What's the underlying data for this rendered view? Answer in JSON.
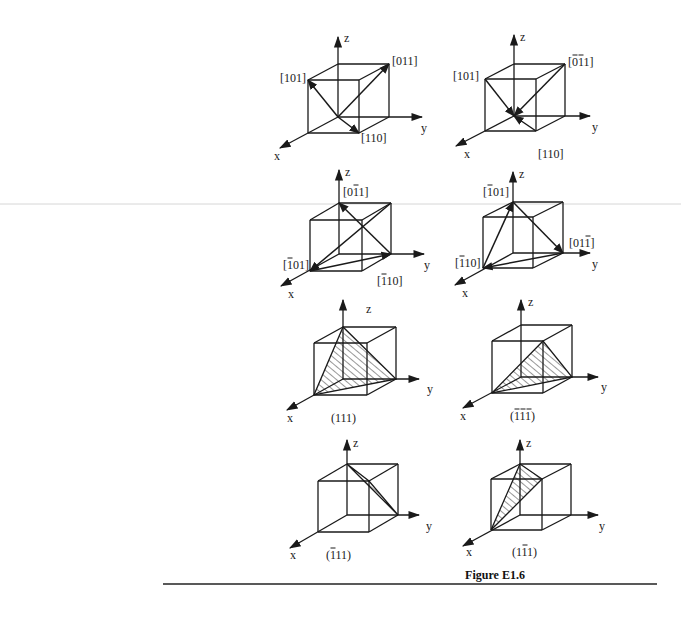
{
  "figure": {
    "caption": "Figure E1.6",
    "rule": {
      "x1": 163,
      "x2": 657,
      "y": 584
    },
    "caption_pos": {
      "x": 495,
      "y": 579
    },
    "scanline_y": 204,
    "axis_labels": {
      "x": "x",
      "y": "y",
      "z": "z"
    },
    "panels": [
      {
        "id": "p1",
        "type": "directions",
        "origin": [
          338,
          117
        ],
        "ux": [
          -30,
          16
        ],
        "uy": [
          51,
          0
        ],
        "uz": [
          0,
          -53
        ],
        "axis_ends": {
          "x": [
            280,
            148
          ],
          "y": [
            422,
            117
          ],
          "z": [
            338,
            37
          ]
        },
        "axis_label_pos": {
          "x": [
            274,
            160
          ],
          "y": [
            421,
            132
          ],
          "z": [
            344,
            42
          ]
        },
        "vectors": [
          {
            "from": [
              0,
              0,
              0
            ],
            "to": [
              1,
              0,
              1
            ],
            "label": "[101]",
            "overbar": [],
            "label_pos": [
              280,
              82
            ]
          },
          {
            "from": [
              0,
              0,
              0
            ],
            "to": [
              0,
              1,
              1
            ],
            "label": "[011]",
            "overbar": [],
            "label_pos": [
              392,
              65
            ]
          },
          {
            "from": [
              0,
              0,
              0
            ],
            "to": [
              1,
              1,
              0
            ],
            "label": "[110]",
            "overbar": [],
            "label_pos": [
              361,
              142
            ]
          }
        ]
      },
      {
        "id": "p2",
        "type": "directions",
        "origin": [
          514,
          116
        ],
        "ux": [
          -29,
          15
        ],
        "uy": [
          51,
          0
        ],
        "uz": [
          0,
          -52
        ],
        "axis_ends": {
          "x": [
            456,
            146
          ],
          "y": [
            590,
            116
          ],
          "z": [
            514,
            35
          ]
        },
        "axis_label_pos": {
          "x": [
            464,
            158
          ],
          "y": [
            592,
            131
          ],
          "z": [
            520,
            41
          ]
        },
        "vectors": [
          {
            "from": [
              1,
              0,
              1
            ],
            "to": [
              0,
              0,
              0
            ],
            "label": "[101]",
            "overbar": [],
            "label_pos": [
              453,
              80
            ]
          },
          {
            "from": [
              0,
              1,
              1
            ],
            "to": [
              0,
              0,
              0
            ],
            "label": "[011]",
            "overbar": [
              1,
              2
            ],
            "label_pos": [
              568,
              66
            ]
          },
          {
            "from": [
              1,
              1,
              0
            ],
            "to": [
              0,
              0,
              0
            ],
            "label": "[110]",
            "overbar": [],
            "label_pos": [
              538,
              158
            ]
          }
        ]
      },
      {
        "id": "p3",
        "type": "directions",
        "origin": [
          339,
          254
        ],
        "ux": [
          -29,
          17
        ],
        "uy": [
          52,
          0
        ],
        "uz": [
          0,
          -51
        ],
        "axis_ends": {
          "x": [
            281,
            286
          ],
          "y": [
            424,
            254
          ],
          "z": [
            339,
            170
          ]
        },
        "axis_label_pos": {
          "x": [
            288,
            298
          ],
          "y": [
            424,
            269
          ],
          "z": [
            345,
            176
          ]
        },
        "vectors": [
          {
            "from": [
              0,
              1,
              1
            ],
            "to": [
              1,
              0,
              0
            ],
            "label": "[101]",
            "overbar": [
              1
            ],
            "label_pos": [
              283,
              269
            ]
          },
          {
            "from": [
              0,
              1,
              0
            ],
            "to": [
              0,
              0,
              1
            ],
            "label": "[011]",
            "overbar": [
              2
            ],
            "label_pos": [
              343,
              196
            ]
          },
          {
            "from": [
              1,
              0,
              0
            ],
            "to": [
              0,
              1,
              0
            ],
            "label": "[110]",
            "overbar": [
              1
            ],
            "label_pos": [
              377,
              285
            ]
          }
        ]
      },
      {
        "id": "p4",
        "type": "directions",
        "origin": [
          513,
          253
        ],
        "ux": [
          -30,
          15
        ],
        "uy": [
          50,
          0
        ],
        "uz": [
          0,
          -51
        ],
        "axis_ends": {
          "x": [
            455,
            285
          ],
          "y": [
            590,
            253
          ],
          "z": [
            513,
            172
          ]
        },
        "axis_label_pos": {
          "x": [
            462,
            297
          ],
          "y": [
            592,
            268
          ],
          "z": [
            519,
            178
          ]
        },
        "vectors": [
          {
            "from": [
              1,
              0,
              0
            ],
            "to": [
              0,
              0,
              1
            ],
            "label": "[101]",
            "overbar": [
              1
            ],
            "label_pos": [
              483,
              196
            ]
          },
          {
            "from": [
              0,
              0,
              1
            ],
            "to": [
              0,
              1,
              0
            ],
            "label": "[011]",
            "overbar": [
              3
            ],
            "label_pos": [
              569,
              247
            ]
          },
          {
            "from": [
              0,
              1,
              0
            ],
            "to": [
              1,
              0,
              0
            ],
            "label": "[110]",
            "overbar": [
              1
            ],
            "label_pos": [
              455,
              267
            ]
          }
        ]
      },
      {
        "id": "p5",
        "type": "plane",
        "origin": [
          343,
          379
        ],
        "ux": [
          -29,
          16
        ],
        "uy": [
          53,
          0
        ],
        "uz": [
          0,
          -52
        ],
        "axis_ends": {
          "x": [
            287,
            410
          ],
          "y": [
            419,
            379
          ],
          "z": [
            343,
            300
          ]
        },
        "axis_label_pos": {
          "x": [
            287,
            422
          ],
          "y": [
            427,
            393
          ],
          "z": [
            366,
            313
          ]
        },
        "plane_vertices": [
          [
            0,
            0,
            1
          ],
          [
            1,
            0,
            0
          ],
          [
            0,
            1,
            0
          ]
        ],
        "label": "(111)",
        "overbar": [],
        "label_pos": [
          331,
          422
        ]
      },
      {
        "id": "p6",
        "type": "plane",
        "origin": [
          521,
          377
        ],
        "ux": [
          -29,
          16
        ],
        "uy": [
          51,
          0
        ],
        "uz": [
          0,
          -52
        ],
        "axis_ends": {
          "x": [
            463,
            408
          ],
          "y": [
            598,
            377
          ],
          "z": [
            521,
            300
          ]
        },
        "axis_label_pos": {
          "x": [
            460,
            420
          ],
          "y": [
            601,
            391
          ],
          "z": [
            528,
            306
          ]
        },
        "plane_vertices": [
          [
            1,
            1,
            1
          ],
          [
            1,
            0,
            0
          ],
          [
            0,
            1,
            0
          ]
        ],
        "label": "(111)",
        "overbar": [
          1,
          2,
          3
        ],
        "label_pos": [
          510,
          420
        ]
      },
      {
        "id": "p7",
        "type": "plane",
        "origin": [
          347,
          515
        ],
        "ux": [
          -29,
          17
        ],
        "uy": [
          51,
          0
        ],
        "uz": [
          0,
          -51
        ],
        "axis_ends": {
          "x": [
            290,
            548
          ],
          "y": [
            419,
            515
          ],
          "z": [
            347,
            440
          ]
        },
        "axis_label_pos": {
          "x": [
            290,
            559
          ],
          "y": [
            426,
            530
          ],
          "z": [
            353,
            447
          ]
        },
        "plane_vertices": [
          [
            0,
            0,
            1
          ],
          [
            1,
            1,
            1
          ],
          [
            0,
            1,
            0
          ]
        ],
        "label": "(111)",
        "overbar": [
          1
        ],
        "label_pos": [
          326,
          559
        ]
      },
      {
        "id": "p8",
        "type": "plane",
        "origin": [
          520,
          515
        ],
        "ux": [
          -29,
          15
        ],
        "uy": [
          51,
          0
        ],
        "uz": [
          0,
          -51
        ],
        "axis_ends": {
          "x": [
            463,
            546
          ],
          "y": [
            598,
            515
          ],
          "z": [
            520,
            440
          ]
        },
        "axis_label_pos": {
          "x": [
            466,
            556
          ],
          "y": [
            599,
            530
          ],
          "z": [
            526,
            447
          ]
        },
        "plane_vertices": [
          [
            0,
            0,
            1
          ],
          [
            1,
            1,
            1
          ],
          [
            1,
            0,
            0
          ]
        ],
        "label": "(111)",
        "overbar": [
          2
        ],
        "label_pos": [
          512,
          556
        ]
      }
    ]
  }
}
